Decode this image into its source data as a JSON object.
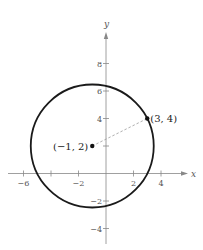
{
  "diagram": {
    "type": "coordinate-plane-circle",
    "axes": {
      "x_label": "x",
      "y_label": "y",
      "x_range": [
        -7,
        6
      ],
      "y_range": [
        -5,
        10
      ],
      "x_ticks": [
        {
          "value": -6,
          "label": "−6"
        },
        {
          "value": -4,
          "label": ""
        },
        {
          "value": -2,
          "label": "−2"
        },
        {
          "value": 2,
          "label": "2"
        },
        {
          "value": 4,
          "label": "4"
        }
      ],
      "y_ticks": [
        {
          "value": 8,
          "label": "8"
        },
        {
          "value": 6,
          "label": "6"
        },
        {
          "value": 4,
          "label": "4"
        },
        {
          "value": 2,
          "label": ""
        },
        {
          "value": -2,
          "label": "−2"
        },
        {
          "value": -4,
          "label": "−4"
        }
      ]
    },
    "circle": {
      "center": [
        -1,
        2
      ],
      "radius_squared": 20
    },
    "points": [
      {
        "name": "center",
        "x": -1,
        "y": 2,
        "label": "(−1, 2)",
        "label_side": "left"
      },
      {
        "name": "point-on-circle",
        "x": 3,
        "y": 4,
        "label": "(3, 4)",
        "label_side": "right"
      }
    ],
    "segment": {
      "from": [
        -1,
        2
      ],
      "to": [
        3,
        4
      ],
      "style": "dashed"
    },
    "colors": {
      "axis": "#888888",
      "circle": "#1a1a1a",
      "segment": "#999999",
      "point": "#111111"
    }
  }
}
